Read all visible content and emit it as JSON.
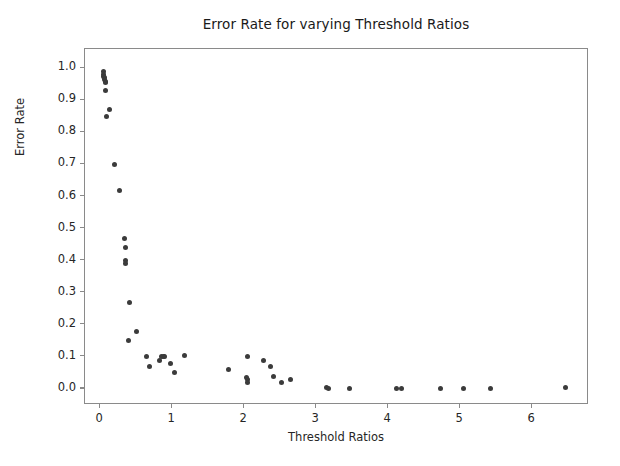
{
  "chart_data": {
    "type": "scatter",
    "title": "Error Rate for varying Threshold Ratios",
    "xlabel": "Threshold Ratios",
    "ylabel": "Error Rate",
    "xlim": [
      -0.21,
      6.79
    ],
    "ylim": [
      -0.05,
      1.06
    ],
    "grid": false,
    "legend": null,
    "marker_color": "#3b3b3b",
    "marker_size": 5,
    "xticks": [
      0,
      1,
      2,
      3,
      4,
      5,
      6
    ],
    "xtick_labels": [
      "0",
      "1",
      "2",
      "3",
      "4",
      "5",
      "6"
    ],
    "yticks": [
      0.0,
      0.1,
      0.2,
      0.3,
      0.4,
      0.5,
      0.6,
      0.7,
      0.8,
      0.9,
      1.0
    ],
    "ytick_labels": [
      "0.0",
      "0.1",
      "0.2",
      "0.3",
      "0.4",
      "0.5",
      "0.6",
      "0.7",
      "0.8",
      "0.9",
      "1.0"
    ],
    "series": [
      {
        "name": "error rate",
        "points": [
          [
            0.04,
            0.99
          ],
          [
            0.05,
            0.98
          ],
          [
            0.05,
            0.975
          ],
          [
            0.06,
            0.97
          ],
          [
            0.06,
            0.965
          ],
          [
            0.07,
            0.96
          ],
          [
            0.07,
            0.955
          ],
          [
            0.08,
            0.93
          ],
          [
            0.13,
            0.87
          ],
          [
            0.09,
            0.85
          ],
          [
            0.2,
            0.7
          ],
          [
            0.27,
            0.62
          ],
          [
            0.34,
            0.47
          ],
          [
            0.35,
            0.44
          ],
          [
            0.35,
            0.4
          ],
          [
            0.35,
            0.39
          ],
          [
            0.41,
            0.27
          ],
          [
            0.5,
            0.18
          ],
          [
            0.4,
            0.15
          ],
          [
            0.65,
            0.1
          ],
          [
            0.68,
            0.07
          ],
          [
            0.82,
            0.09
          ],
          [
            0.85,
            0.1
          ],
          [
            0.88,
            0.1
          ],
          [
            0.9,
            0.1
          ],
          [
            0.98,
            0.08
          ],
          [
            1.03,
            0.05
          ],
          [
            1.17,
            0.105
          ],
          [
            1.78,
            0.06
          ],
          [
            2.05,
            0.1
          ],
          [
            2.03,
            0.035
          ],
          [
            2.04,
            0.03
          ],
          [
            2.04,
            0.02
          ],
          [
            2.27,
            0.09
          ],
          [
            2.36,
            0.07
          ],
          [
            2.41,
            0.04
          ],
          [
            2.52,
            0.02
          ],
          [
            2.65,
            0.03
          ],
          [
            3.15,
            0.005
          ],
          [
            3.17,
            0.0
          ],
          [
            3.46,
            0.0
          ],
          [
            4.12,
            0.0
          ],
          [
            4.18,
            0.0
          ],
          [
            4.73,
            0.0
          ],
          [
            5.05,
            0.0
          ],
          [
            5.42,
            0.0
          ],
          [
            6.47,
            0.006
          ]
        ]
      }
    ]
  }
}
